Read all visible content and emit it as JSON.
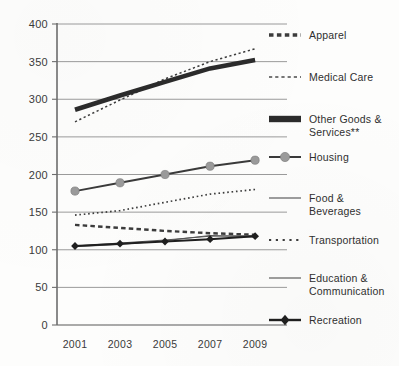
{
  "chart_data": {
    "type": "line",
    "title": "",
    "subtitle": "",
    "xlabel": "",
    "ylabel": "",
    "x": [
      2001,
      2003,
      2005,
      2007,
      2009
    ],
    "xtick_labels": [
      "2001",
      "2003",
      "2005",
      "2007",
      "2009"
    ],
    "ytick_labels": [
      "0",
      "50",
      "100",
      "150",
      "200",
      "250",
      "300",
      "350",
      "400"
    ],
    "ytick_values": [
      0,
      50,
      100,
      150,
      200,
      250,
      300,
      350,
      400
    ],
    "ylim": [
      0,
      400
    ],
    "grid": "horizontal",
    "legend_position": "right",
    "series": [
      {
        "name": "Apparel",
        "style": "dashed-thick",
        "color": "#3c3c3c",
        "marker": "none",
        "values": [
          133,
          129,
          125,
          122,
          120
        ]
      },
      {
        "name": "Medical Care",
        "style": "dashed-fine",
        "color": "#3c3c3c",
        "marker": "none",
        "values": [
          270,
          299,
          327,
          350,
          367
        ]
      },
      {
        "name": "Other Goods &\nServices**",
        "style": "solid-heavy",
        "color": "#2b2b2b",
        "marker": "none",
        "values": [
          286,
          305,
          323,
          341,
          352
        ]
      },
      {
        "name": "Housing",
        "style": "solid-marker",
        "color": "#3a3a3a",
        "marker": "circle",
        "marker_color": "#9a9a9a",
        "values": [
          178,
          189,
          200,
          211,
          219
        ]
      },
      {
        "name": "Food & Beverages",
        "style": "solid-thin",
        "color": "#555555",
        "marker": "none",
        "values": [
          105,
          109,
          113,
          118,
          119
        ]
      },
      {
        "name": "Transportation",
        "style": "dotted",
        "color": "#3c3c3c",
        "marker": "none",
        "values": [
          146,
          152,
          163,
          174,
          180
        ]
      },
      {
        "name": "Education &\nCommunication",
        "style": "solid-thin",
        "color": "#555555",
        "marker": "none",
        "values": [
          104,
          107,
          112,
          119,
          117
        ]
      },
      {
        "name": "Recreation",
        "style": "solid-marker",
        "color": "#1f1f1f",
        "marker": "diamond",
        "marker_color": "#1f1f1f",
        "values": [
          105,
          108,
          111,
          114,
          118
        ]
      }
    ]
  },
  "legend": {
    "items": [
      {
        "label": "Apparel",
        "swatch": "dashed-thick-swatch"
      },
      {
        "label": "Medical Care",
        "swatch": "dashed-fine-swatch"
      },
      {
        "label": "Other Goods &\nServices**",
        "swatch": "solid-heavy-swatch"
      },
      {
        "label": "Housing",
        "swatch": "circle-marker-swatch"
      },
      {
        "label": "Food & Beverages",
        "swatch": "solid-thin-swatch"
      },
      {
        "label": "Transportation",
        "swatch": "dotted-swatch"
      },
      {
        "label": "Education &\nCommunication",
        "swatch": "solid-thin-swatch"
      },
      {
        "label": "Recreation",
        "swatch": "diamond-marker-swatch"
      }
    ]
  },
  "axes": {
    "y_labels": [
      "400",
      "350",
      "300",
      "250",
      "200",
      "150",
      "100",
      "50",
      "0"
    ],
    "x_labels": [
      "2001",
      "2003",
      "2005",
      "2007",
      "2009"
    ]
  }
}
